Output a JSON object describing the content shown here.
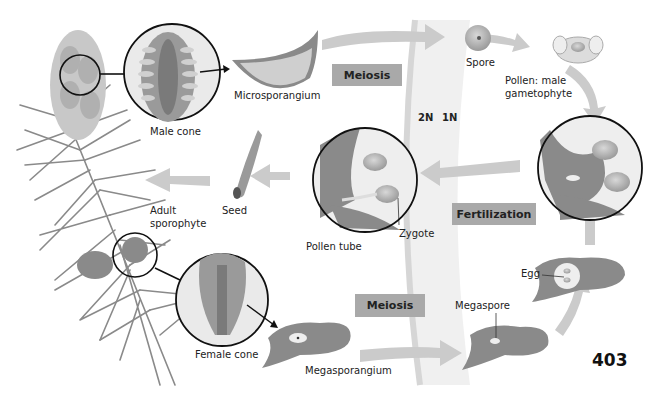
{
  "diagram": {
    "page_number": "403",
    "ploidy": {
      "diploid": "2N",
      "haploid": "1N"
    },
    "process_labels": {
      "meiosis_male": "Meiosis",
      "meiosis_female": "Meiosis",
      "fertilization": "Fertilization"
    },
    "structures": {
      "male_cone": "Male cone",
      "microsporangium": "Microsporangium",
      "spore": "Spore",
      "pollen_line1": "Pollen: male",
      "pollen_line2": "gametophyte",
      "seed": "Seed",
      "adult_line1": "Adult",
      "adult_line2": "sporophyte",
      "pollen_tube": "Pollen tube",
      "zygote": "Zygote",
      "female_cone": "Female cone",
      "megasporangium": "Megasporangium",
      "megaspore": "Megaspore",
      "egg": "Egg"
    },
    "colors": {
      "tissue": "#8a8a8a",
      "arrow": "#c8c8c8",
      "label_box": "#a9a9a9",
      "band": "#ececec"
    }
  }
}
